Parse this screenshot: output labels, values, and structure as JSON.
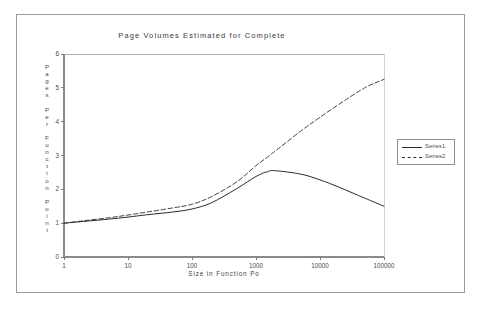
{
  "chart_data": {
    "type": "line",
    "title": "Page Volumes Estimated for Complete",
    "xlabel": "Size in Function Po",
    "ylabel": "Pages Per Function Point",
    "xscale": "log",
    "xlim": [
      1,
      100000
    ],
    "ylim": [
      0,
      6
    ],
    "grid": false,
    "legend_position": "right-outside",
    "xticks": [
      "1",
      "10",
      "100",
      "1000",
      "10000",
      "100000"
    ],
    "xtick_values": [
      1,
      10,
      100,
      1000,
      10000,
      100000
    ],
    "yticks": [
      "0",
      "1",
      "2",
      "3",
      "4",
      "5",
      "6"
    ],
    "ytick_values": [
      0,
      1,
      2,
      3,
      4,
      5,
      6
    ],
    "x": [
      1,
      2,
      5,
      10,
      20,
      50,
      100,
      200,
      500,
      1000,
      1500,
      2000,
      5000,
      10000,
      20000,
      50000,
      100000
    ],
    "series": [
      {
        "name": "Series1",
        "style": "solid",
        "color": "#2b2b2b",
        "values": [
          1.0,
          1.05,
          1.12,
          1.18,
          1.25,
          1.33,
          1.42,
          1.6,
          2.02,
          2.38,
          2.52,
          2.55,
          2.45,
          2.28,
          2.06,
          1.74,
          1.5
        ]
      },
      {
        "name": "Series2",
        "style": "dashed",
        "color": "#2b2b2b",
        "values": [
          1.0,
          1.07,
          1.16,
          1.24,
          1.33,
          1.45,
          1.56,
          1.78,
          2.22,
          2.7,
          2.95,
          3.13,
          3.72,
          4.13,
          4.52,
          5.0,
          5.25
        ]
      }
    ]
  },
  "legend": {
    "entries": [
      {
        "label": "Series1"
      },
      {
        "label": "Series2"
      }
    ]
  }
}
